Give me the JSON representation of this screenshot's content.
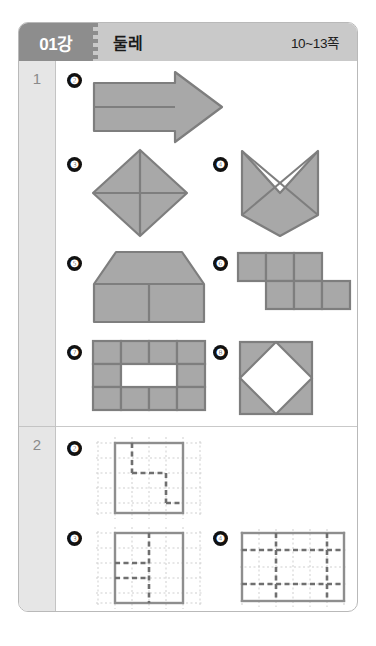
{
  "header": {
    "lesson_label": "01강",
    "title": "둘레",
    "pages": "10~13쪽"
  },
  "sections": [
    {
      "number": "1"
    },
    {
      "number": "2"
    }
  ],
  "section1": {
    "number": "1",
    "items": [
      {
        "marker": "❷",
        "name": "arrow-pentagon-shape"
      },
      {
        "marker": "❸",
        "name": "rhombus-with-diagonals-shape"
      },
      {
        "marker": "❹",
        "name": "chevron-notched-square-shape"
      },
      {
        "marker": "❺",
        "name": "house-trapezoid-shape"
      },
      {
        "marker": "❻",
        "name": "offset-hexomino-shape"
      },
      {
        "marker": "❼",
        "name": "ring-frame-grid-shape"
      },
      {
        "marker": "❽",
        "name": "square-with-inscribed-diamond-shape"
      }
    ]
  },
  "section2": {
    "number": "2",
    "items": [
      {
        "marker": "❷",
        "name": "dotted-grid-path-2"
      },
      {
        "marker": "❸",
        "name": "dotted-grid-path-3"
      },
      {
        "marker": "❹",
        "name": "dotted-grid-path-4"
      }
    ]
  },
  "colors": {
    "header_bar": "#c9c9c9",
    "header_badge": "#8d8d8d",
    "shape_fill": "#a8a8a8",
    "shape_stroke": "#7e7e7e",
    "number_column": "#e6e6e6",
    "card_border": "#b9b9b9",
    "grid_dot": "#c9c9c9",
    "grid_border": "#8e8e8e",
    "path_dash": "#6f6f6f",
    "marker_bg": "#111111"
  }
}
